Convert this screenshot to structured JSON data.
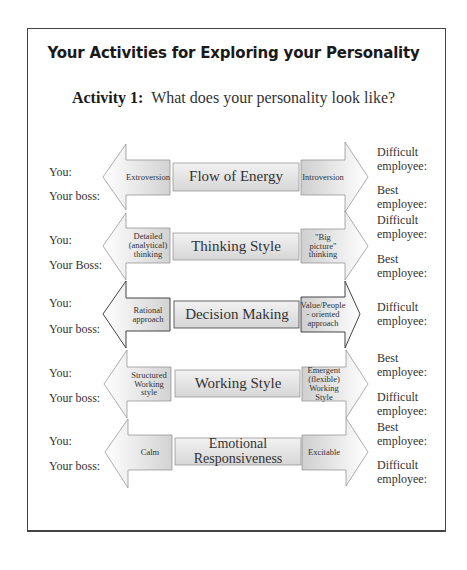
{
  "title": "Your Activities for Exploring your Personality",
  "activity": {
    "label": "Activity 1:",
    "question": "What does your personality look like?"
  },
  "rows": [
    {
      "left_labels": [
        "You:",
        "Your boss:"
      ],
      "left_trait": "Extroversion",
      "dimension": "Flow of Energy",
      "right_trait": "Introversion",
      "right_labels": [
        "Difficult employee:",
        "Best employee:"
      ]
    },
    {
      "left_labels": [
        "You:",
        "Your Boss:"
      ],
      "left_trait": "Detailed (analytical) thinking",
      "dimension": "Thinking Style",
      "right_trait": "\"Big picture\" thinking",
      "right_labels": [
        "Difficult employee:",
        "Best employee:"
      ]
    },
    {
      "left_labels": [
        "You:",
        "Your boss:"
      ],
      "left_trait": "Rational approach",
      "dimension": "Decision Making",
      "right_trait": "Value/People - oriented approach",
      "right_labels": [
        "Difficult employee:"
      ]
    },
    {
      "left_labels": [
        "You:",
        "Your boss:"
      ],
      "left_trait": "Structured Working style",
      "dimension": "Working Style",
      "right_trait": "Emergent (flexible) Working Style",
      "right_labels": [
        "Best employee:",
        "Difficult employee:"
      ]
    },
    {
      "left_labels": [
        "You:",
        "Your boss:"
      ],
      "left_trait": "Calm",
      "dimension": "Emotional Responsiveness",
      "right_trait": "Excitable",
      "right_labels": [
        "Best employee:",
        "Difficult employee:"
      ]
    }
  ],
  "colors": {
    "frame": "#444444",
    "arrow_fill_light": "#f4f4f4",
    "arrow_fill_dark": "#c8c8c8",
    "arrow_stroke": "#8a8a8a",
    "center_box": "#e6e6e6"
  }
}
